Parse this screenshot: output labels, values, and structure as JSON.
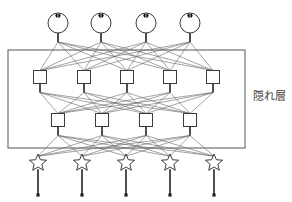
{
  "diagram": {
    "label_hidden_layer": "隠れ層",
    "colors": {
      "stroke": "#3a3a3a",
      "edge": "#666666",
      "strong_edge": "#222222",
      "fill": "#ffffff",
      "pupil": "#111111",
      "border": "#555555",
      "background": "#ffffff"
    },
    "layers": [
      {
        "name": "output-circle-layer",
        "node_shape": "circle",
        "count": 4,
        "y": 23,
        "radius": 10,
        "x": [
          58,
          101,
          146,
          190
        ],
        "marker": "pupil-dot"
      },
      {
        "name": "hidden-layer-1",
        "node_shape": "square",
        "count": 5,
        "y": 77,
        "size": 13,
        "x": [
          40,
          84,
          127,
          170,
          213
        ]
      },
      {
        "name": "hidden-layer-2",
        "node_shape": "square",
        "count": 4,
        "y": 120,
        "size": 13,
        "x": [
          58,
          102,
          146,
          190
        ]
      },
      {
        "name": "input-star-layer",
        "node_shape": "star",
        "count": 5,
        "y": 163,
        "size": 9,
        "x": [
          38,
          82,
          126,
          170,
          214
        ],
        "stem_end_y": 195,
        "stem_end_marker": "dot"
      }
    ],
    "enclosure": {
      "name": "hidden-layer-box",
      "x": 8,
      "y": 50,
      "width": 237,
      "height": 98
    },
    "label_position": {
      "x": 253,
      "y": 91
    }
  }
}
